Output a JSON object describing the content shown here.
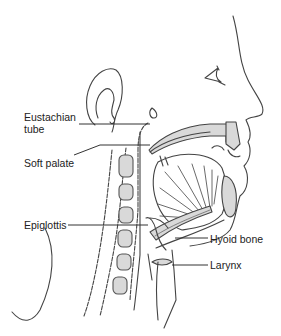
{
  "labels": {
    "eustachian_tube_line1": "Eustachian",
    "eustachian_tube_line2": "tube",
    "soft_palate": "Soft palate",
    "epiglottis": "Epiglottis",
    "hyoid_bone": "Hyoid bone",
    "larynx": "Larynx"
  },
  "colors": {
    "line": "#333333",
    "bone_fill": "#d9d9d9",
    "background": "#ffffff"
  }
}
